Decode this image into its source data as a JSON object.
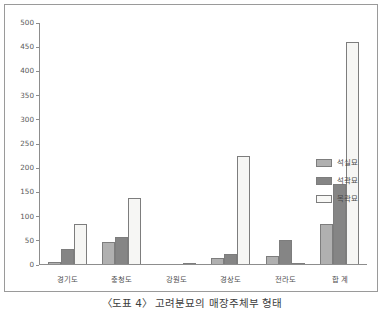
{
  "caption": "〈도표 4〉 고려분묘의 매장주체부 형태",
  "legend": {
    "position": "right",
    "items": [
      {
        "label": "석실묘",
        "color": "#b0b0b0"
      },
      {
        "label": "석곽묘",
        "color": "#858585"
      },
      {
        "label": "목곽묘",
        "color": "#f6f6f4"
      }
    ]
  },
  "chart_data": {
    "type": "bar",
    "title": "〈도표 4〉 고려분묘의 매장주체부 형태",
    "xlabel": "",
    "ylabel": "",
    "ylim": [
      0,
      500
    ],
    "ytick_step": 50,
    "yticks": [
      0,
      50,
      100,
      150,
      200,
      250,
      300,
      350,
      400,
      450,
      500
    ],
    "ytick_labels": [
      "0",
      "50",
      "100",
      "150",
      "200",
      "250",
      "300",
      "350",
      "400",
      "450",
      "500"
    ],
    "grid": false,
    "legend_position": "right",
    "categories": [
      "경기도",
      "충청도",
      "강원도",
      "경상도",
      "전라도",
      "합 계"
    ],
    "series": [
      {
        "name": "석실묘",
        "color": "#b0b0b0",
        "values": [
          5,
          45,
          0,
          13,
          17,
          83
        ]
      },
      {
        "name": "석곽묘",
        "color": "#858585",
        "values": [
          32,
          57,
          0,
          20,
          49,
          166
        ]
      },
      {
        "name": "목곽묘",
        "color": "#f6f6f4",
        "values": [
          83,
          137,
          3,
          224,
          3,
          460
        ]
      }
    ]
  }
}
